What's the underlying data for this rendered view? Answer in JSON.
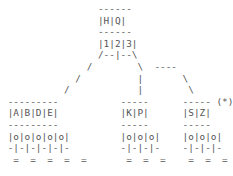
{
  "figure": {
    "type": "ascii-art-tree-diagram",
    "background_color": "#ffffff",
    "text_color": "#555555",
    "char_width_px": 5.64,
    "line_height_px": 11.6,
    "annotation_marker": "(*)",
    "root": {
      "name": "root-node",
      "header_rule": "------",
      "cells": [
        "H",
        "Q"
      ],
      "cells_text": "|H|Q|",
      "divider_rule": "------",
      "second_row_cells": [
        "1",
        "2",
        "3"
      ],
      "second_row_text": "|1|2|3|",
      "branch_row_text": "/--|--\\"
    },
    "children": [
      {
        "name": "left-child-node",
        "header_rule": "---------",
        "cells": [
          "A",
          "B",
          "D",
          "E"
        ],
        "cells_text": "|A|B|D|E|",
        "divider_rule": "---------",
        "slots": [
          "o",
          "o",
          "o",
          "o",
          "o"
        ],
        "slots_text": "|o|o|o|o|o|",
        "pins_text": "-|-|-|-|-|-",
        "ground_text": "=  =  =  =  =",
        "ground_count": 5,
        "annotated": false
      },
      {
        "name": "middle-child-node",
        "header_rule": "-----",
        "cells": [
          "K",
          "P"
        ],
        "cells_text": "|K|P|",
        "divider_rule": "-----",
        "slots": [
          "o",
          "o",
          "o"
        ],
        "slots_text": "|o|o|o|",
        "pins_text": "-|-|-|-",
        "ground_text": "=  =  =",
        "ground_count": 3,
        "annotated": false
      },
      {
        "name": "right-child-node",
        "header_rule": "-----",
        "cells": [
          "S",
          "Z"
        ],
        "cells_text": "|S|Z|",
        "divider_rule": "-----",
        "slots": [
          "o",
          "o",
          "o"
        ],
        "slots_text": "|o|o|o|",
        "pins_text": "-|-|-|-",
        "ground_text": "=  =  =",
        "ground_count": 3,
        "annotated": true,
        "annotation": "(*)"
      }
    ],
    "connectors": {
      "left_branch_glyph": "/",
      "middle_branch_glyph": "|",
      "right_branch_glyph": "\\",
      "right_jog_rule": "----"
    }
  },
  "art": {
    "lines": [
      "                 ------",
      "                 |H|Q|",
      "                 ------",
      "                 |1|2|3|",
      "                 /--|--\\",
      "               /        \\  ----",
      "             /          |       \\",
      "           /            |        \\",
      " ---------           -----      ----- (*)",
      " |A|B|D|E|           |K|P|      |S|Z|",
      " ---------           -----      -----",
      " |o|o|o|o|o|         |o|o|o|    |o|o|o|",
      " -|-|-|-|-|-         -|-|-|-    -|-|-|-",
      "  =  =  =  =  =       =  =  =    =  =  ="
    ]
  }
}
